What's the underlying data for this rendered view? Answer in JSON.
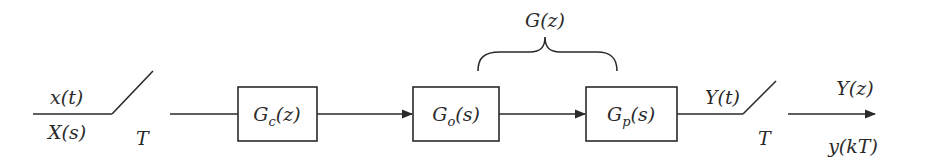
{
  "diagram": {
    "type": "block-diagram",
    "input": {
      "signal_time": "x(t)",
      "signal_laplace": "X(s)"
    },
    "input_sampler": {
      "period_label": "T"
    },
    "blocks": [
      {
        "id": "controller",
        "main": "G",
        "sub": "c",
        "arg": "(z)"
      },
      {
        "id": "zoh",
        "main": "G",
        "sub": "o",
        "arg": "(s)"
      },
      {
        "id": "plant",
        "main": "G",
        "sub": "p",
        "arg": "(s)"
      }
    ],
    "group": {
      "label": "G(z)",
      "spans": [
        "zoh",
        "plant"
      ]
    },
    "output": {
      "signal_time": "Y(t)"
    },
    "output_sampler": {
      "period_label": "T"
    },
    "sampled_output": {
      "z_domain": "Y(z)",
      "sequence": "y(kT)"
    },
    "colors": {
      "stroke": "#2a2a2a",
      "background": "#ffffff"
    }
  }
}
